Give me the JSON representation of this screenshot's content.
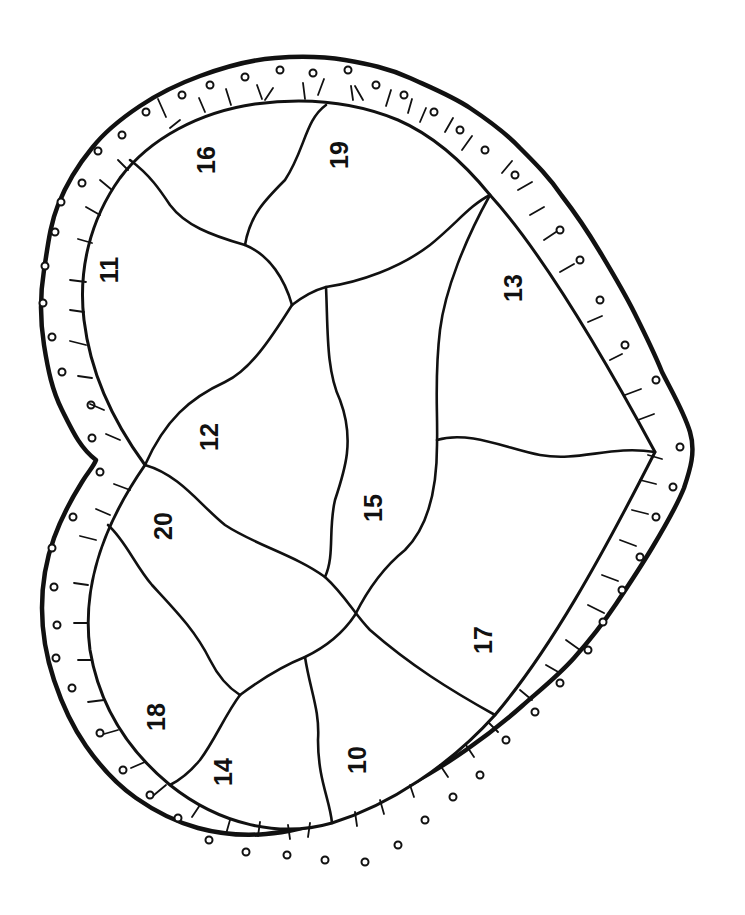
{
  "page": {
    "type": "color-by-number coloring page",
    "orientation": "rotated 90 degrees clockwise",
    "line_color": "#111111",
    "background": "#ffffff"
  },
  "regions": [
    {
      "id": "r10",
      "label": "10",
      "x": 355,
      "y": 760,
      "rotate": -90
    },
    {
      "id": "r11",
      "label": "11",
      "x": 108,
      "y": 270,
      "rotate": -90
    },
    {
      "id": "r12",
      "label": "12",
      "x": 208,
      "y": 437,
      "rotate": -90
    },
    {
      "id": "r13",
      "label": "13",
      "x": 512,
      "y": 288,
      "rotate": -90
    },
    {
      "id": "r14",
      "label": "14",
      "x": 222,
      "y": 772,
      "rotate": -90
    },
    {
      "id": "r15",
      "label": "15",
      "x": 372,
      "y": 508,
      "rotate": -90
    },
    {
      "id": "r16",
      "label": "16",
      "x": 206,
      "y": 160,
      "rotate": -90
    },
    {
      "id": "r17",
      "label": "17",
      "x": 482,
      "y": 640,
      "rotate": -90
    },
    {
      "id": "r18",
      "label": "18",
      "x": 155,
      "y": 717,
      "rotate": -90
    },
    {
      "id": "r19",
      "label": "19",
      "x": 338,
      "y": 155,
      "rotate": -90
    },
    {
      "id": "r20",
      "label": "20",
      "x": 162,
      "y": 526,
      "rotate": -90
    }
  ]
}
